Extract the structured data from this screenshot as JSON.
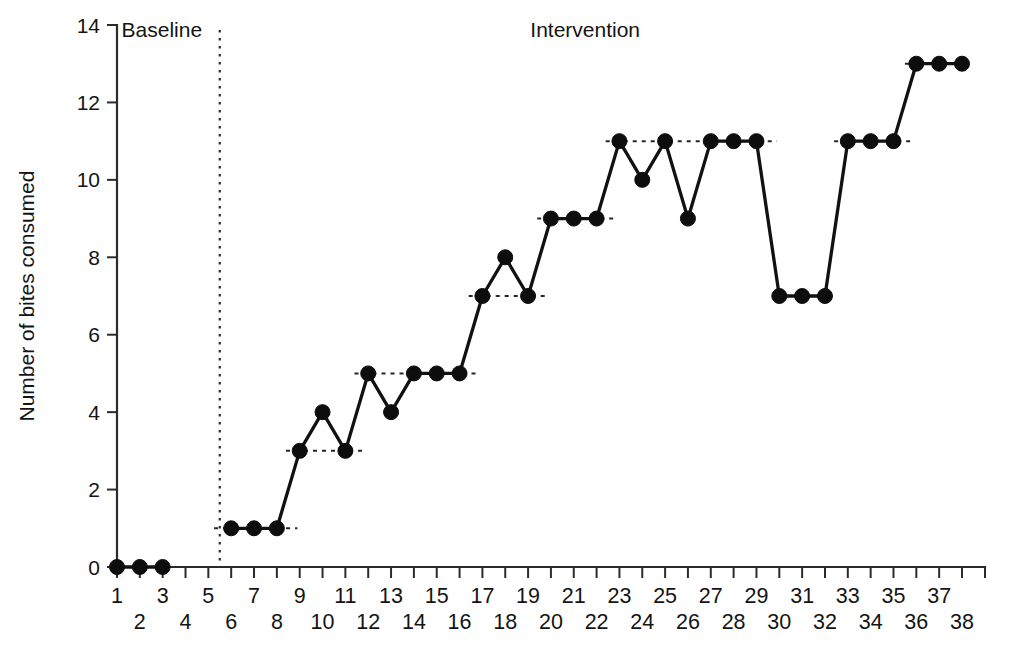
{
  "chart_data": {
    "type": "line",
    "title": "",
    "xlabel": "",
    "ylabel": "Number of bites consumed",
    "xlim": [
      0.2,
      39.2
    ],
    "ylim": [
      0,
      14
    ],
    "grid": false,
    "legend": "none",
    "y_ticks": [
      0,
      2,
      4,
      6,
      8,
      10,
      12,
      14
    ],
    "y_tick_labels": [
      "0",
      "2",
      "4",
      "6",
      "8",
      "10",
      "12",
      "14"
    ],
    "x_ticks": [
      1,
      2,
      3,
      4,
      5,
      6,
      7,
      8,
      9,
      10,
      11,
      12,
      13,
      14,
      15,
      16,
      17,
      18,
      19,
      20,
      21,
      22,
      23,
      24,
      25,
      26,
      27,
      28,
      29,
      30,
      31,
      32,
      33,
      34,
      35,
      36,
      37,
      38
    ],
    "x_tick_labels_odd": [
      "1",
      "3",
      "5",
      "7",
      "9",
      "11",
      "13",
      "15",
      "17",
      "19",
      "21",
      "23",
      "25",
      "27",
      "29",
      "31",
      "33",
      "35",
      "37"
    ],
    "x_tick_labels_even": [
      "2",
      "4",
      "6",
      "8",
      "10",
      "12",
      "14",
      "16",
      "18",
      "20",
      "22",
      "24",
      "26",
      "28",
      "30",
      "32",
      "34",
      "36",
      "38"
    ],
    "phase_divider_x": 5.5,
    "annotations": [
      {
        "text": "Baseline",
        "x": 1.2,
        "y": 13.7,
        "align": "left"
      },
      {
        "text": "Intervention",
        "x": 21.5,
        "y": 13.7,
        "align": "middle"
      }
    ],
    "series": [
      {
        "name": "Baseline",
        "x": [
          1,
          2,
          3
        ],
        "values": [
          0,
          0,
          0
        ]
      },
      {
        "name": "Intervention",
        "x": [
          6,
          7,
          8,
          9,
          10,
          11,
          12,
          13,
          14,
          15,
          16,
          17,
          18,
          19,
          20,
          21,
          22,
          23,
          24,
          25,
          26,
          27,
          28,
          29,
          30,
          31,
          32,
          33,
          34,
          35,
          36,
          37,
          38
        ],
        "values": [
          1,
          1,
          1,
          3,
          4,
          3,
          5,
          4,
          5,
          5,
          5,
          7,
          8,
          7,
          9,
          9,
          9,
          11,
          10,
          11,
          9,
          11,
          11,
          11,
          7,
          7,
          7,
          11,
          11,
          11,
          13,
          13,
          13
        ]
      }
    ],
    "criterion_lines": [
      {
        "level": 0,
        "x_start": 0.75,
        "x_end": 3.35
      },
      {
        "level": 1,
        "x_start": 5.25,
        "x_end": 8.9
      },
      {
        "level": 3,
        "x_start": 8.4,
        "x_end": 11.9
      },
      {
        "level": 5,
        "x_start": 11.4,
        "x_end": 16.9
      },
      {
        "level": 7,
        "x_start": 16.4,
        "x_end": 19.9
      },
      {
        "level": 9,
        "x_start": 19.4,
        "x_end": 22.9
      },
      {
        "level": 11,
        "x_start": 22.4,
        "x_end": 29.9
      },
      {
        "level": 11,
        "x_start": 32.4,
        "x_end": 35.9
      },
      {
        "level": 13,
        "x_start": 35.5,
        "x_end": 36.3
      }
    ],
    "colors": {
      "line": "#111111",
      "marker": "#0d0d0d",
      "axis": "#2b2b2b",
      "text": "#141414",
      "background": "#ffffff"
    },
    "marker_radius_px": 7.5
  }
}
